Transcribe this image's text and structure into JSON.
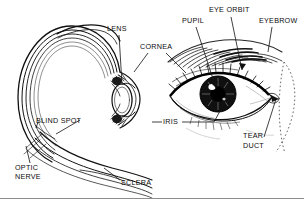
{
  "figure": {
    "type": "anatomical-diagram",
    "background_color": "#ffffff",
    "ink_color": "#111111",
    "width": 304,
    "height": 199,
    "panels": [
      {
        "name": "eye-cross-section",
        "side": "left"
      },
      {
        "name": "eye-front-view",
        "side": "right"
      }
    ]
  },
  "labels": {
    "lens": "LENS",
    "cornea": "CORNEA",
    "pupil": "PUPIL",
    "eye_orbit": "EYE ORBIT",
    "eyebrow": "EYEBROW",
    "blind_spot": "BLIND SPOT",
    "iris": "IRIS",
    "optic_nerve_line1": "OPTIC",
    "optic_nerve_line2": "NERVE",
    "sclera": "SCLERA",
    "tear_duct_line1": "TEAR",
    "tear_duct_line2": "DUCT"
  }
}
